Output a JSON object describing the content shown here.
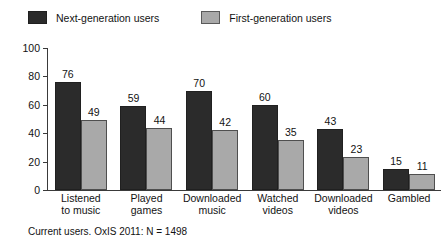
{
  "chart_data": {
    "type": "bar",
    "title": "",
    "xlabel": "",
    "ylabel": "% of the population who have ever",
    "ylim": [
      0,
      100
    ],
    "yticks": [
      0,
      20,
      40,
      60,
      80,
      100
    ],
    "grid": false,
    "legend_position": "top-left",
    "categories": [
      "Listened\nto music",
      "Played\ngames",
      "Downloaded\nmusic",
      "Watched\nvideos",
      "Downloaded\nvideos",
      "Gambled"
    ],
    "category_lines": [
      [
        "Listened",
        "to music"
      ],
      [
        "Played",
        "games"
      ],
      [
        "Downloaded",
        "music"
      ],
      [
        "Watched",
        "videos"
      ],
      [
        "Downloaded",
        "videos"
      ],
      [
        "Gambled"
      ]
    ],
    "series": [
      {
        "name": "Next-generation users",
        "color": "#2b2b2b",
        "values": [
          76,
          59,
          70,
          60,
          43,
          15
        ]
      },
      {
        "name": "First-generation users",
        "color": "#a9a9a9",
        "values": [
          49,
          44,
          42,
          35,
          23,
          11
        ]
      }
    ],
    "annotation": "Current users. OxIS 2011: N = 1498"
  },
  "legend": {
    "items": [
      {
        "label": "Next-generation users",
        "swatch": "dark-swatch-icon"
      },
      {
        "label": "First-generation users",
        "swatch": "light-swatch-icon"
      }
    ]
  },
  "footnote": "Current users. OxIS 2011: N = 1498"
}
